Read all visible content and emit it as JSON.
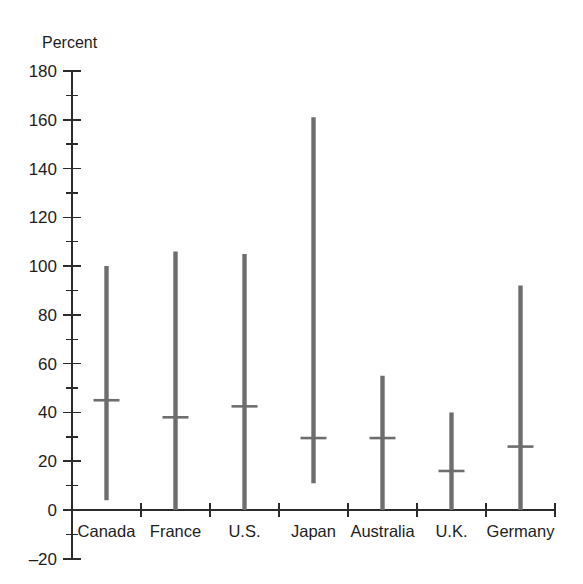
{
  "chart_data": {
    "type": "bar",
    "title": "",
    "subtitle": "",
    "xlabel": "",
    "ylabel": "Percent",
    "ylim": [
      -20,
      180
    ],
    "y_major_step": 20,
    "y_minor_step": 10,
    "grid": false,
    "legend": "none",
    "orientation": "vertical",
    "style": "range bars with median marker",
    "categories": [
      "Canada",
      "France",
      "U.S.",
      "Japan",
      "Australia",
      "U.K.",
      "Germany"
    ],
    "y_tick_labels": [
      "180",
      "160",
      "140",
      "120",
      "100",
      "80",
      "60",
      "40",
      "20",
      "0",
      "-20"
    ],
    "y_tick_values": [
      180,
      160,
      140,
      120,
      100,
      80,
      60,
      40,
      20,
      0,
      -20
    ],
    "series": [
      {
        "name": "Range high",
        "values": [
          100,
          106,
          105,
          161,
          55,
          40,
          92
        ]
      },
      {
        "name": "Range low",
        "values": [
          4,
          0,
          0,
          11,
          0,
          0,
          0
        ]
      },
      {
        "name": "Median marker",
        "values": [
          45,
          38,
          42.5,
          29.5,
          29.5,
          16,
          26
        ]
      }
    ],
    "points": [
      {
        "category": "Canada",
        "low": 4,
        "high": 100,
        "marker": 45
      },
      {
        "category": "France",
        "low": 0,
        "high": 106,
        "marker": 38
      },
      {
        "category": "U.S.",
        "low": 0,
        "high": 105,
        "marker": 42.5
      },
      {
        "category": "Japan",
        "low": 11,
        "high": 161,
        "marker": 29.5
      },
      {
        "category": "Australia",
        "low": 0,
        "high": 55,
        "marker": 29.5
      },
      {
        "category": "U.K.",
        "low": 0,
        "high": 40,
        "marker": 16
      },
      {
        "category": "Germany",
        "low": 0,
        "high": 92,
        "marker": 26
      }
    ],
    "colors": {
      "bar": "#6e6e6e",
      "marker": "#6e6e6e",
      "axis": "#2b2b2b",
      "text": "#1d1d1d",
      "background": "#ffffff"
    }
  }
}
